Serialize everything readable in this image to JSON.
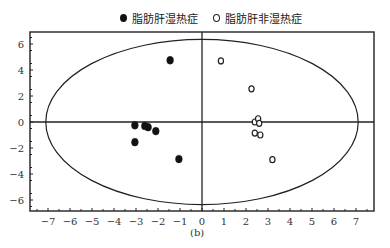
{
  "chart_data": {
    "type": "scatter",
    "title": "",
    "caption": "(b)",
    "xlabel": "",
    "ylabel": "",
    "xlim": [
      -7.9,
      7.8
    ],
    "ylim": [
      -6.9,
      6.9
    ],
    "x_ticks": [
      -7,
      -6,
      -5,
      -4,
      -3,
      -2,
      -1,
      0,
      1,
      2,
      3,
      4,
      5,
      6,
      7
    ],
    "x_tick_labels": [
      "−7",
      "−6",
      "−5",
      "−4",
      "−3",
      "−2",
      "−1",
      "0",
      "1",
      "2",
      "3",
      "4",
      "5",
      "6",
      "7"
    ],
    "y_ticks": [
      6,
      4,
      2,
      0,
      -2,
      -4,
      -6
    ],
    "y_tick_labels": [
      "6",
      "4",
      "2",
      "0",
      "−2",
      "−4",
      "−6"
    ],
    "grid": false,
    "legend_position": "top",
    "confidence_ellipse": {
      "cx": 0,
      "cy": 0,
      "rx": 7.1,
      "ry": 6.35
    },
    "series": [
      {
        "name": "脂肪肝湿热症",
        "marker": "filled-circle",
        "points": [
          {
            "x": -1.45,
            "y": 4.75
          },
          {
            "x": -3.05,
            "y": -0.25
          },
          {
            "x": -2.6,
            "y": -0.3
          },
          {
            "x": -2.45,
            "y": -0.4
          },
          {
            "x": -2.1,
            "y": -0.7
          },
          {
            "x": -3.05,
            "y": -1.55
          },
          {
            "x": -1.05,
            "y": -2.85
          }
        ]
      },
      {
        "name": "脂肪肝非湿热症",
        "marker": "hollow-circle",
        "points": [
          {
            "x": 0.86,
            "y": 4.7
          },
          {
            "x": 2.25,
            "y": 2.55
          },
          {
            "x": 2.4,
            "y": 0.0
          },
          {
            "x": 2.55,
            "y": 0.25
          },
          {
            "x": 2.6,
            "y": -0.1
          },
          {
            "x": 2.4,
            "y": -0.85
          },
          {
            "x": 2.65,
            "y": -1.0
          },
          {
            "x": 3.2,
            "y": -2.9
          }
        ]
      }
    ]
  },
  "legend": {
    "items": [
      {
        "label": "脂肪肝湿热症",
        "marker": "filled-circle"
      },
      {
        "label": "脂肪肝非湿热症",
        "marker": "hollow-circle"
      }
    ]
  }
}
